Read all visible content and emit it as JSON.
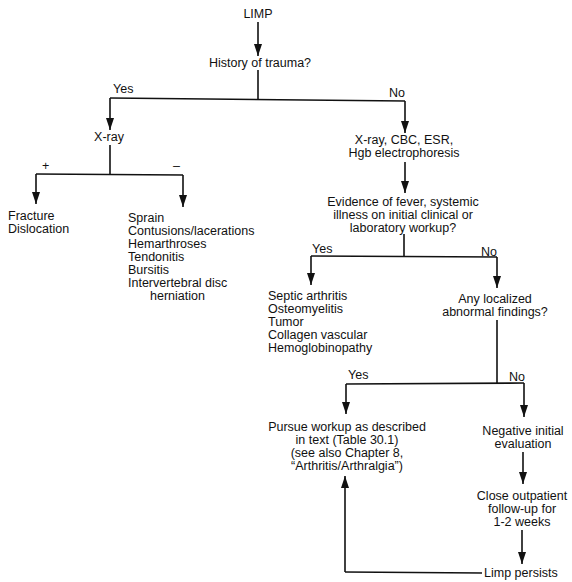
{
  "diagram": {
    "type": "flowchart",
    "nodes": {
      "limp": "LIMP",
      "history_of_trauma": "History of trauma?",
      "xray": "X-ray",
      "fracture": [
        "Fracture",
        "Dislocation"
      ],
      "xray_negative_list": [
        "Sprain",
        "Contusions/lacerations",
        "Hemarthroses",
        "Tendonitis",
        "Bursitis",
        "Intervertebral disc",
        "herniation"
      ],
      "xray_cbc": [
        "X-ray, CBC, ESR,",
        "Hgb electrophoresis"
      ],
      "evidence_fever": [
        "Evidence of fever, systemic",
        "illness on initial clinical or",
        "laboratory workup?"
      ],
      "systemic_list": [
        "Septic arthritis",
        "Osteomyelitis",
        "Tumor",
        "Collagen vascular",
        "Hemoglobinopathy"
      ],
      "any_localized": [
        "Any localized",
        "abnormal findings?"
      ],
      "pursue_workup": [
        "Pursue workup as described",
        "in text (Table 30.1)",
        "(see also Chapter 8,",
        "“Arthritis/Arthralgia”)"
      ],
      "negative_initial": [
        "Negative initial",
        "evaluation"
      ],
      "close_followup": [
        "Close outpatient",
        "follow-up for",
        "1-2 weeks"
      ],
      "limp_persists": "Limp persists"
    },
    "edge_labels": {
      "trauma_yes": "Yes",
      "trauma_no": "No",
      "xray_positive": "+",
      "xray_negative": "–",
      "fever_yes": "Yes",
      "fever_no": "No",
      "localized_yes": "Yes",
      "localized_no": "No"
    },
    "colors": {
      "line": "#111111",
      "background": "#ffffff"
    }
  }
}
